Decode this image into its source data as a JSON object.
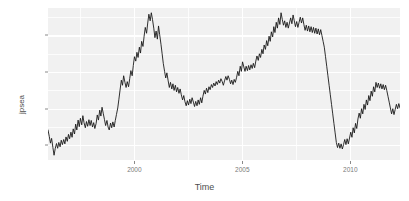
{
  "chart_data": {
    "type": "line",
    "title": "",
    "xlabel": "Time",
    "ylabel": "jpsea",
    "xlim": [
      1996.0,
      2012.3
    ],
    "ylim": [
      76.0,
      117.5
    ],
    "grid": true,
    "legend": "none",
    "line_color": "#1a1a1a",
    "panel_color": "#f1f1f1",
    "gridline_color": "#ffffff",
    "x_ticks": [
      2000,
      2005,
      2010
    ],
    "x_tick_labels": [
      "2000",
      "2005",
      "2010"
    ],
    "x_minor_ticks": [
      1997.5,
      2002.5,
      2007.5
    ],
    "y_ticks": [
      80,
      90,
      100,
      110
    ],
    "y_tick_labels": [
      "80",
      "90",
      "100",
      "110"
    ],
    "y_minor_ticks": [
      85,
      95,
      105,
      115
    ],
    "x": [
      1996.08,
      1996.17,
      1996.25,
      1996.33,
      1996.42,
      1996.5,
      1996.58,
      1996.67,
      1996.75,
      1996.83,
      1996.92,
      1997.0,
      1997.08,
      1997.17,
      1997.25,
      1997.33,
      1997.42,
      1997.5,
      1997.58,
      1997.67,
      1997.75,
      1997.83,
      1997.92,
      1998.0,
      1998.08,
      1998.17,
      1998.25,
      1998.33,
      1998.42,
      1998.5,
      1998.58,
      1998.67,
      1998.75,
      1998.83,
      1998.92,
      1999.0,
      1999.08,
      1999.17,
      1999.25,
      1999.33,
      1999.42,
      1999.5,
      1999.58,
      1999.67,
      1999.75,
      1999.83,
      1999.92,
      2000.0,
      2000.08,
      2000.17,
      2000.25,
      2000.33,
      2000.42,
      2000.5,
      2000.58,
      2000.67,
      2000.75,
      2000.83,
      2000.92,
      2001.0,
      2001.08,
      2001.17,
      2001.25,
      2001.33,
      2001.42,
      2001.5,
      2001.58,
      2001.67,
      2001.75,
      2001.83,
      2001.92,
      2002.0,
      2002.08,
      2002.17,
      2002.25,
      2002.33,
      2002.42,
      2002.5,
      2002.58,
      2002.67,
      2002.75,
      2002.83,
      2002.92,
      2003.0,
      2003.08,
      2003.17,
      2003.25,
      2003.33,
      2003.42,
      2003.5,
      2003.58,
      2003.67,
      2003.75,
      2003.83,
      2003.92,
      2004.0,
      2004.08,
      2004.17,
      2004.25,
      2004.33,
      2004.42,
      2004.5,
      2004.58,
      2004.67,
      2004.75,
      2004.83,
      2004.92,
      2005.0,
      2005.08,
      2005.17,
      2005.25,
      2005.33,
      2005.42,
      2005.5,
      2005.58,
      2005.67,
      2005.75,
      2005.83,
      2005.92,
      2006.0,
      2006.08,
      2006.17,
      2006.25,
      2006.33,
      2006.42,
      2006.5,
      2006.58,
      2006.67,
      2006.75,
      2006.83,
      2006.92,
      2007.0,
      2007.08,
      2007.17,
      2007.25,
      2007.33,
      2007.42,
      2007.5,
      2007.58,
      2007.67,
      2007.75,
      2007.83,
      2007.92,
      2008.0,
      2008.08,
      2008.17,
      2008.25,
      2008.33,
      2008.42,
      2008.5,
      2008.58,
      2008.67,
      2008.75,
      2008.83,
      2008.92,
      2009.0,
      2009.08,
      2009.17,
      2009.25,
      2009.33,
      2009.42,
      2009.5,
      2009.58,
      2009.67,
      2009.75,
      2009.83,
      2009.92,
      2010.0,
      2010.08,
      2010.17,
      2010.25,
      2010.33,
      2010.42,
      2010.5,
      2010.58,
      2010.67,
      2010.75,
      2010.83,
      2010.92,
      2011.0,
      2011.08,
      2011.17,
      2011.25,
      2011.33,
      2011.42,
      2011.5,
      2011.58,
      2011.67,
      2011.75,
      2011.83,
      2011.92,
      2012.0,
      2012.08,
      2012.17
    ],
    "y": [
      84.2,
      82.4,
      80.6,
      81.9,
      79.4,
      77.3,
      79.1,
      80.5,
      79.2,
      80.8,
      79.6,
      81.4,
      80.2,
      81.6,
      80.4,
      82.3,
      81.1,
      83.0,
      81.8,
      83.6,
      82.2,
      84.5,
      83.1,
      85.8,
      84.2,
      86.9,
      85.1,
      87.4,
      85.6,
      88.1,
      86.2,
      84.8,
      86.5,
      85.2,
      87.0,
      85.4,
      86.8,
      85.0,
      86.2,
      84.6,
      86.0,
      88.3,
      86.9,
      89.6,
      88.0,
      90.4,
      88.6,
      87.0,
      85.4,
      86.8,
      85.0,
      84.2,
      86.1,
      84.8,
      86.4,
      85.0,
      86.8,
      88.4,
      90.2,
      92.6,
      95.1,
      97.8,
      96.4,
      99.0,
      97.2,
      95.8,
      97.4,
      96.0,
      98.2,
      100.4,
      99.0,
      101.8,
      104.2,
      103.0,
      105.4,
      104.0,
      106.8,
      105.2,
      108.4,
      107.0,
      109.8,
      112.2,
      110.6,
      113.4,
      115.8,
      114.0,
      116.2,
      114.4,
      112.0,
      109.4,
      111.2,
      109.0,
      112.6,
      110.2,
      107.6,
      105.0,
      102.4,
      100.2,
      98.4,
      99.8,
      97.6,
      95.8,
      97.2,
      95.4,
      96.8,
      95.0,
      96.4,
      94.6,
      95.8,
      94.2,
      95.4,
      93.8,
      92.4,
      93.6,
      92.0,
      90.8,
      92.2,
      91.0,
      92.6,
      91.4,
      93.0,
      91.8,
      90.6,
      92.0,
      90.8,
      92.4,
      91.2,
      93.0,
      91.6,
      93.4,
      95.0,
      94.0,
      95.6,
      94.4,
      96.0,
      95.2,
      96.6,
      95.8,
      97.0,
      96.2,
      97.4,
      96.6,
      97.8,
      97.0,
      98.2,
      97.4,
      96.4,
      97.6,
      98.8,
      97.8,
      99.0,
      98.0,
      96.8,
      97.8,
      96.6,
      98.0,
      97.2,
      98.6,
      100.2,
      99.0,
      101.6,
      100.2,
      102.8,
      101.4,
      100.2,
      101.6,
      100.4,
      101.8,
      100.6,
      102.0,
      101.0,
      102.4,
      101.2,
      103.0,
      104.4,
      103.2,
      105.0,
      104.0,
      106.2,
      105.0,
      107.4,
      106.2,
      108.6,
      107.2,
      109.8,
      108.4,
      111.0,
      109.6,
      112.4,
      110.8,
      113.6,
      112.0,
      114.8,
      113.0
    ],
    "y2": [
      116.2,
      114.4,
      112.8,
      114.0,
      112.2,
      113.6,
      112.0,
      113.4,
      114.8,
      113.2,
      115.6,
      114.0,
      112.4,
      113.8,
      112.2,
      113.6,
      115.0,
      113.4,
      114.8,
      113.0,
      111.4,
      112.8,
      111.2,
      112.6,
      111.0,
      112.4,
      110.8,
      112.2,
      110.6,
      112.0,
      110.4,
      111.8,
      110.2,
      111.6,
      110.0,
      108.4,
      106.8,
      104.2,
      101.6,
      99.0,
      96.4,
      93.8,
      91.2,
      88.6,
      86.0,
      83.4,
      80.8,
      79.4,
      80.6,
      79.2,
      80.4,
      79.0,
      80.2,
      81.6,
      80.2,
      81.8,
      80.4,
      82.0,
      83.6,
      82.2,
      84.8,
      83.4,
      86.0,
      84.6,
      87.2,
      88.8,
      87.4,
      90.0,
      88.6,
      91.2,
      89.8,
      92.4,
      91.0,
      93.6,
      92.2,
      94.8,
      93.4,
      96.0,
      94.6,
      97.2,
      95.8,
      97.0,
      95.6,
      96.8,
      95.4,
      96.6,
      95.2,
      96.4,
      95.0,
      93.4,
      91.8,
      90.2,
      88.6,
      90.0,
      88.4,
      89.8,
      91.2,
      90.0,
      91.4,
      90.2
    ]
  },
  "axis": {
    "x_title": "Time",
    "y_title": "jpsea"
  }
}
